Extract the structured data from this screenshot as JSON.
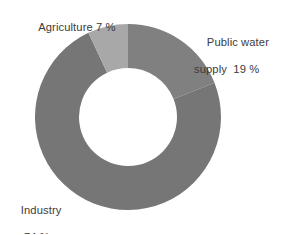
{
  "chart_data": {
    "type": "pie",
    "variant": "donut",
    "title": "",
    "subtitle": "",
    "xlabel": "",
    "ylabel": "",
    "legend_position": "none",
    "grid": false,
    "unit": "%",
    "total": 100,
    "center_hole_ratio": 0.53,
    "start_angle_deg": 0,
    "direction": "clockwise",
    "categories": [
      "Public water supply",
      "Industry",
      "Agriculture"
    ],
    "values": [
      19,
      74,
      7
    ],
    "slices": [
      {
        "name": "Public water supply",
        "value": 19,
        "value_text": "19 %",
        "color": "#808080",
        "start_deg": 0,
        "end_deg": 68.4
      },
      {
        "name": "Industry",
        "value": 74,
        "value_text": "74 %",
        "color": "#767676",
        "start_deg": 68.4,
        "end_deg": 334.8
      },
      {
        "name": "Agriculture",
        "value": 7,
        "value_text": "7 %",
        "color": "#a8a8a8",
        "start_deg": 334.8,
        "end_deg": 360
      }
    ],
    "annotations": [
      {
        "id": "agriculture",
        "line1": "Agriculture 7 %",
        "line2": ""
      },
      {
        "id": "public-water",
        "line1": "Public water",
        "line2": "supply  19 %"
      },
      {
        "id": "industry",
        "line1": "Industry",
        "line2": "74 %"
      }
    ]
  },
  "labels": {
    "agriculture": {
      "line1": "Agriculture 7 %"
    },
    "public_water": {
      "line1": "Public water",
      "line2": "supply  19 %"
    },
    "industry": {
      "line1": "Industry",
      "line2": "74 %"
    }
  },
  "colors": {
    "background": "#ffffff",
    "hole": "#ffffff",
    "text": "#3b3b3b",
    "public_water": "#808080",
    "industry": "#767676",
    "agriculture": "#a8a8a8"
  },
  "geometry": {
    "center_x": 128,
    "center_y": 117,
    "outer_radius": 93,
    "inner_radius": 49
  }
}
